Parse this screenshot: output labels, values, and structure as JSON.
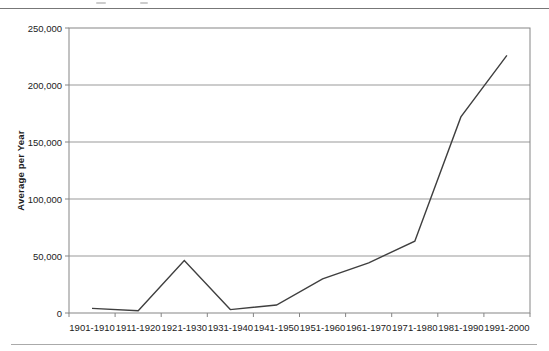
{
  "page": {
    "background": "#ffffff",
    "top_rule_color": "#777777",
    "bottom_rule_color": "#aaaaaa"
  },
  "chart_data": {
    "type": "line",
    "title": "",
    "xlabel": "",
    "ylabel": "Average per Year",
    "categories": [
      "1901-1910",
      "1911-1920",
      "1921-1930",
      "1931-1940",
      "1941-1950",
      "1951-1960",
      "1961-1970",
      "1971-1980",
      "1981-1990",
      "1991-2000"
    ],
    "values": [
      4000,
      2000,
      46000,
      3000,
      7000,
      30000,
      44000,
      63000,
      172000,
      226000
    ],
    "ylim": [
      0,
      250000
    ],
    "ytick_interval": 50000,
    "ytick_labels": [
      "0",
      "50,000",
      "100,000",
      "150,000",
      "200,000",
      "250,000"
    ],
    "grid": "horizontal",
    "legend": "none",
    "line_color": "#3f3f3f",
    "grid_color": "#999999",
    "axis_color": "#858585",
    "text_color": "#222222"
  }
}
